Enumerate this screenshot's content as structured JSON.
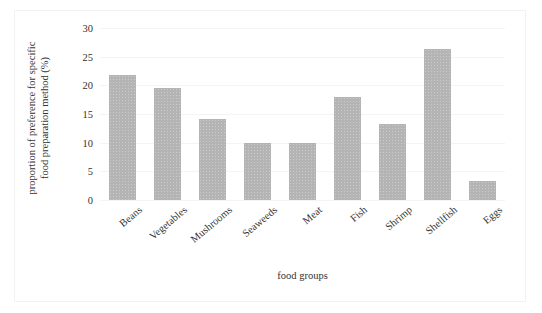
{
  "chart_data": {
    "type": "bar",
    "title": "",
    "xlabel": "food groups",
    "ylabel": "proportion of preference for specific food preparation method (%)",
    "ylabel_lines": [
      "proportion of preference for specific",
      "food  preparation method (%)"
    ],
    "categories": [
      "Beans",
      "Vegetables",
      "Mushrooms",
      "Seaweeds",
      "Meat",
      "Fish",
      "Shrimp",
      "Shellfish",
      "Eggs"
    ],
    "values": [
      21.8,
      19.6,
      14.1,
      9.9,
      9.9,
      17.9,
      13.3,
      26.4,
      3.4
    ],
    "ylim": [
      0,
      30
    ],
    "ytick_labels": [
      "0",
      "5",
      "10",
      "15",
      "20",
      "25",
      "30"
    ],
    "ytick_values": [
      0,
      5,
      10,
      15,
      20,
      25,
      30
    ],
    "grid": true,
    "legend": false,
    "bar_color": "#b4b4b4",
    "grid_color": "#f4f4f4",
    "text_color": "#333333",
    "background": "#ffffff"
  }
}
